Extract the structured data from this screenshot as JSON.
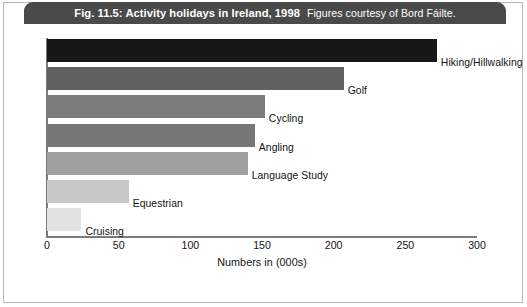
{
  "figure": {
    "title_main": "Fig. 11.5: Activity holidays in Ireland, 1998",
    "title_credit": "Figures courtesy of Bord Fáilte.",
    "title_bar_color": "#4a4a4a",
    "background_color": "#ffffff",
    "border_color": "#b9b9b9"
  },
  "chart_data": {
    "type": "bar",
    "orientation": "horizontal",
    "title": "Fig. 11.5: Activity holidays in Ireland, 1998",
    "subtitle": "Figures courtesy of Bord Fáilte.",
    "categories": [
      "Hiking/Hillwalking",
      "Golf",
      "Cycling",
      "Angling",
      "Language Study",
      "Equestrian",
      "Cruising"
    ],
    "values": [
      272,
      207,
      152,
      145,
      140,
      57,
      24
    ],
    "bar_colors": [
      "#171717",
      "#616161",
      "#7c7c7c",
      "#777777",
      "#a0a0a0",
      "#c8c8c8",
      "#e2e2e2"
    ],
    "xlabel": "Numbers in (000s)",
    "ylabel": "",
    "xlim": [
      0,
      300
    ],
    "xticks": [
      0,
      50,
      100,
      150,
      200,
      250,
      300
    ],
    "xtick_labels": [
      "0",
      "50",
      "100",
      "150",
      "200",
      "250",
      "300"
    ],
    "grid": false,
    "legend": false,
    "axis_color": "#7b7b7b"
  }
}
